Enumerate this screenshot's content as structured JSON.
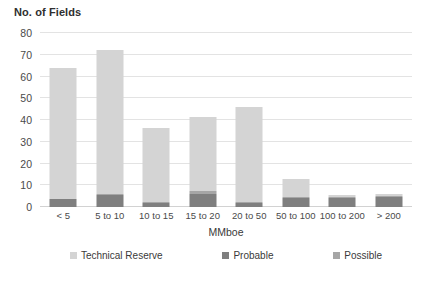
{
  "chart_data": {
    "type": "bar",
    "title": "",
    "ylabel": "No. of Fields",
    "xlabel": "MMboe",
    "ylim": [
      0,
      80
    ],
    "yticks": [
      0,
      10,
      20,
      30,
      40,
      50,
      60,
      70,
      80
    ],
    "grid": true,
    "stacked": true,
    "legend_position": "bottom",
    "categories": [
      "< 5",
      "5 to 10",
      "10 to 15",
      "15 to 20",
      "20 to 50",
      "50 to 100",
      "100 to 200",
      "> 200"
    ],
    "series": [
      {
        "name": "Probable",
        "color": "#7f7f7f",
        "values": [
          3.5,
          5.5,
          2,
          6,
          2,
          4,
          4,
          4.5
        ]
      },
      {
        "name": "Possible",
        "color": "#a6a6a6",
        "values": [
          0,
          0.5,
          0.5,
          1.5,
          0.5,
          0.5,
          0.5,
          0.5
        ]
      },
      {
        "name": "Technical Reserve",
        "color": "#d4d4d4",
        "values": [
          60.5,
          66,
          34,
          34,
          43.5,
          8.5,
          1,
          1
        ]
      }
    ],
    "totals": [
      64,
      72,
      36.5,
      41.5,
      46,
      13,
      5.5,
      6
    ],
    "legend": [
      {
        "label": "Technical Reserve",
        "color": "#d4d4d4"
      },
      {
        "label": "Probable",
        "color": "#7f7f7f"
      },
      {
        "label": "Possible",
        "color": "#a6a6a6"
      }
    ]
  },
  "colors": {
    "technical_reserve": "#d4d4d4",
    "probable": "#7f7f7f",
    "possible": "#a6a6a6",
    "gridline": "#e3e3e3",
    "axis_text": "#4a4a4a",
    "background": "#ffffff"
  }
}
